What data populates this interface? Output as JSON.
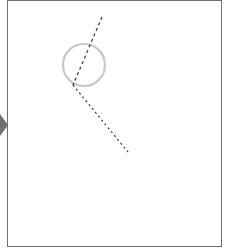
{
  "diagram": {
    "frame": {
      "border_color": "#6e6e6e",
      "background": "#ffffff"
    },
    "side_arrow": {
      "icon": "chevron-right-icon",
      "color": "#707070"
    },
    "circle": {
      "cx": 84,
      "cy": 65,
      "r": 21,
      "stroke": "#c8c8c8"
    },
    "dashed_lines": [
      {
        "x1": 102,
        "y1": 17,
        "x2": 73,
        "y2": 85,
        "stroke": "#333333"
      },
      {
        "x1": 73,
        "y1": 85,
        "x2": 128,
        "y2": 152,
        "stroke": "#333333"
      }
    ]
  }
}
